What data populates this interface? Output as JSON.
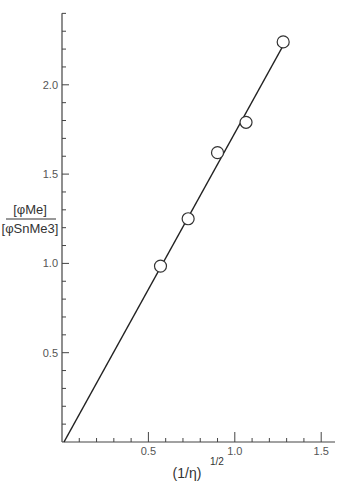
{
  "chart_data": {
    "type": "scatter",
    "title": "",
    "xlabel": "(1/η)^1/2",
    "ylabel": "[φMe] / [φSnMe3]",
    "ylabel_numerator": "[φMe]",
    "ylabel_denominator": "[φSnMe3]",
    "xlabel_base": "1/η",
    "xlabel_exponent": "1/2",
    "xlim": [
      0,
      1.58
    ],
    "ylim": [
      0,
      2.4
    ],
    "x_ticks": [
      0.5,
      1.0,
      1.5
    ],
    "x_tick_labels": [
      "0.5",
      "1.0",
      "1.5"
    ],
    "x_minor_tick_step": 0.1,
    "y_ticks": [
      0.5,
      1.0,
      1.5,
      2.0
    ],
    "y_tick_labels": [
      "0.5",
      "1.0",
      "1.5",
      "2.0"
    ],
    "y_minor_tick_step": 0.1,
    "grid": false,
    "legend": null,
    "series": [
      {
        "name": "data",
        "marker": "open-circle",
        "x": [
          0.57,
          0.73,
          0.9,
          1.065,
          1.28
        ],
        "y": [
          0.985,
          1.25,
          1.62,
          1.79,
          2.24
        ]
      }
    ],
    "fit_line": {
      "x": [
        0.0,
        1.28
      ],
      "y": [
        0.0,
        2.22
      ]
    }
  }
}
